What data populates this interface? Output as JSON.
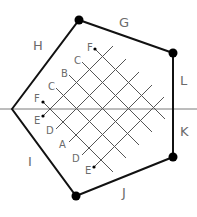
{
  "diagram": {
    "pentagon": {
      "vertices": [
        [
          12,
          109
        ],
        [
          79,
          20
        ],
        [
          173,
          53
        ],
        [
          173,
          157
        ],
        [
          76,
          196
        ]
      ],
      "dotted_vertices": [
        [
          79,
          20
        ],
        [
          173,
          53
        ],
        [
          173,
          157
        ],
        [
          76,
          196
        ]
      ],
      "edge_labels": [
        {
          "id": "H",
          "text": "H",
          "x": 20,
          "y": 50
        },
        {
          "id": "G",
          "text": "G",
          "x": 119,
          "y": 27
        },
        {
          "id": "L",
          "text": "L",
          "x": 180,
          "y": 85
        },
        {
          "id": "K",
          "text": "K",
          "x": 180,
          "y": 136
        },
        {
          "id": "J",
          "text": "J",
          "x": 122,
          "y": 197
        },
        {
          "id": "I",
          "text": "I",
          "x": 28,
          "y": 166
        }
      ]
    },
    "axis": {
      "y": 109,
      "x1": 0,
      "x2": 197
    },
    "grid": {
      "upper_labels": [
        {
          "text": "F",
          "x": 87,
          "y": 51,
          "dot": [
            95,
            49
          ]
        },
        {
          "text": "C",
          "x": 75,
          "y": 63
        },
        {
          "text": "B",
          "x": 61,
          "y": 76
        },
        {
          "text": "C",
          "x": 48,
          "y": 89
        },
        {
          "text": "F",
          "x": 34,
          "y": 102,
          "dot": [
            43,
            102
          ]
        }
      ],
      "lower_labels": [
        {
          "text": "E",
          "x": 34,
          "y": 124,
          "dot": [
            43,
            116
          ]
        },
        {
          "text": "D",
          "x": 46,
          "y": 133
        },
        {
          "text": "A",
          "x": 59,
          "y": 148
        },
        {
          "text": "D",
          "x": 72,
          "y": 162
        },
        {
          "text": "E",
          "x": 85,
          "y": 173,
          "dot": [
            94,
            167
          ]
        }
      ]
    }
  }
}
